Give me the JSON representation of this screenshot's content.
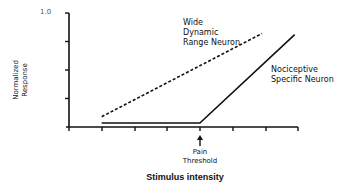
{
  "chart_data": {
    "type": "line",
    "title": "",
    "xlabel": "Stimulus intensity",
    "ylabel": "Normalized Response",
    "ylim": [
      0,
      1.0
    ],
    "xlim": [
      0,
      7
    ],
    "y_tick_labels": [
      "1.0"
    ],
    "y_ticks": [
      0,
      0.25,
      0.5,
      0.75,
      1.0
    ],
    "x_ticks": [
      0,
      1,
      2,
      3,
      4,
      5,
      6,
      7
    ],
    "grid": false,
    "legend": "none (direct labels)",
    "series": [
      {
        "name": "Wide Dynamic Range Neuron",
        "style": "dashed",
        "x": [
          1,
          5.9
        ],
        "y": [
          0.09,
          0.82
        ]
      },
      {
        "name": "Nociceptive Specific Neuron",
        "style": "solid",
        "x": [
          1,
          4,
          6.9
        ],
        "y": [
          0.035,
          0.035,
          0.81
        ]
      }
    ],
    "annotations": [
      {
        "text": "Pain Threshold",
        "x": 4,
        "marker": "up-arrow"
      },
      {
        "text": "Wide Dynamic Range Neuron"
      },
      {
        "text": "Nociceptive Specific Neuron"
      }
    ]
  },
  "labels": {
    "y_axis": "Normalized\nResponse",
    "y_top_tick": "1.0",
    "x_axis": "Stimulus intensity",
    "wdr": "Wide\nDynamic\nRange Neuron",
    "ns": "Nociceptive\nSpecific Neuron",
    "pain": "Pain\nThreshold"
  },
  "colors": {
    "line": "#111111",
    "axis": "#111111",
    "background": "#ffffff"
  }
}
